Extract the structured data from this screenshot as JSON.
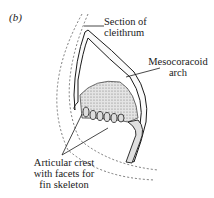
{
  "figure": {
    "panel_label": "(b)",
    "labels": {
      "cleithrum": [
        "Section of",
        "cleithrum"
      ],
      "mesocoracoid": [
        "Mesocoracoid",
        "arch"
      ],
      "articular": [
        "Articular crest",
        "with facets for",
        "fin skeleton"
      ]
    },
    "colors": {
      "ink": "#1a1a1a",
      "stipple": "#9a9a9a",
      "background": "#ffffff"
    }
  }
}
